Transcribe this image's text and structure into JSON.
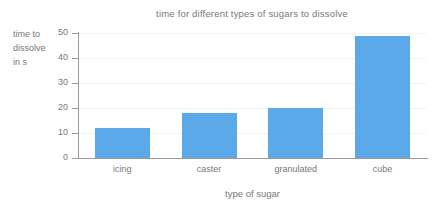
{
  "chart_data": {
    "type": "bar",
    "title": "time for different types of sugars to dissolve",
    "xlabel": "type of sugar",
    "ylabel_lines": [
      "time to",
      "dissolve",
      "in s"
    ],
    "ylabel": "time to dissolve in s",
    "categories": [
      "icing",
      "caster",
      "granulated",
      "cube"
    ],
    "values": [
      12,
      18,
      20,
      49
    ],
    "ylim": [
      0,
      50
    ],
    "yticks": [
      0,
      10,
      20,
      30,
      40,
      50
    ],
    "ytick_labels": [
      "0",
      "10",
      "20",
      "30",
      "40",
      "50"
    ],
    "grid": "horizontal-faint",
    "legend": "none",
    "bar_color": "#5ba9e8",
    "axis_color": "#9a9a9a",
    "text_color": "#777777",
    "background_color": "#ffffff"
  }
}
